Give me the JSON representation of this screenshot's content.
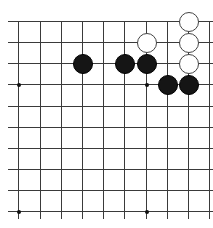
{
  "board": {
    "description": "Go board corner fragment (top-right region, 10x10 intersections visible)",
    "cols_x": [
      18,
      40,
      61,
      82,
      103,
      124,
      146,
      167,
      188,
      209
    ],
    "rows_y": [
      21,
      42,
      63,
      84,
      106,
      127,
      148,
      169,
      190,
      211
    ],
    "line_color": "#3a3a3a",
    "star_points": [
      [
        0,
        3
      ],
      [
        0,
        9
      ],
      [
        6,
        9
      ],
      [
        6,
        3
      ]
    ],
    "stones": [
      {
        "color": "black",
        "col": 3,
        "row": 2
      },
      {
        "color": "black",
        "col": 5,
        "row": 2
      },
      {
        "color": "black",
        "col": 6,
        "row": 2
      },
      {
        "color": "black",
        "col": 7,
        "row": 3
      },
      {
        "color": "black",
        "col": 8,
        "row": 3
      },
      {
        "color": "white",
        "col": 6,
        "row": 1
      },
      {
        "color": "white",
        "col": 8,
        "row": 0
      },
      {
        "color": "white",
        "col": 8,
        "row": 1
      },
      {
        "color": "white",
        "col": 8,
        "row": 2
      }
    ]
  }
}
